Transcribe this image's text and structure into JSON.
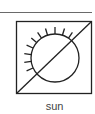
{
  "symbol": {
    "name": "sun",
    "icon": "sun-crossed-icon",
    "label": "sun",
    "stroke_color": "#222222",
    "rule_color": "#6a6a6a",
    "label_color": "#444444"
  }
}
